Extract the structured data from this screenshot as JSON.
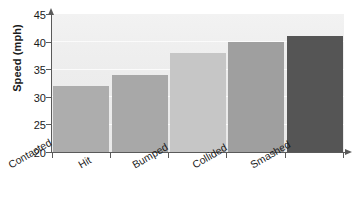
{
  "chart_data": {
    "type": "bar",
    "title": "",
    "subtitle": "",
    "xlabel": "",
    "ylabel": "Speed (mph)",
    "categories": [
      "Contacted",
      "Hit",
      "Bumped",
      "Collided",
      "Smashed"
    ],
    "values": [
      32,
      34,
      38,
      40,
      41
    ],
    "series": [
      {
        "name": "Speed (mph)",
        "values": [
          32,
          34,
          38,
          40,
          41
        ]
      }
    ],
    "ylim": [
      20,
      45
    ],
    "yticks": [
      20,
      25,
      30,
      35,
      40,
      45
    ],
    "ytick_labels": [
      "20",
      "25",
      "30",
      "35",
      "40",
      "45"
    ],
    "xlim": [
      0,
      5
    ],
    "grid": true,
    "grid_axis": "y",
    "legend": false,
    "legend_position": "none",
    "annotations": [],
    "bar_colors": [
      "#adadad",
      "#a8a8a8",
      "#c6c6c6",
      "#9f9f9f",
      "#555555"
    ],
    "plot_background": "#eeeeee",
    "axis_color": "#5a5a5a",
    "text_color": "#1a1a1a",
    "figure_background": "#ffffff"
  }
}
